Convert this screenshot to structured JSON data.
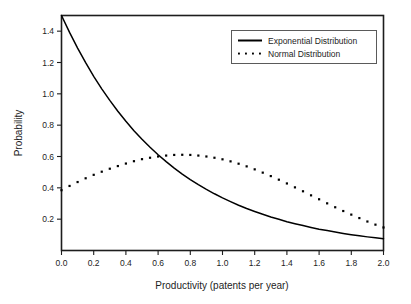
{
  "chart_data": {
    "type": "line",
    "title": "",
    "xlabel": "Productivity (patents per year)",
    "ylabel": "Probability",
    "xlim": [
      0.0,
      2.0
    ],
    "ylim": [
      0.0,
      1.5
    ],
    "xticks": [
      "0.0",
      "0.2",
      "0.4",
      "0.6",
      "0.8",
      "1.0",
      "1.2",
      "1.4",
      "1.6",
      "1.8",
      "2.0"
    ],
    "xtick_values": [
      0.0,
      0.2,
      0.4,
      0.6,
      0.8,
      1.0,
      1.2,
      1.4,
      1.6,
      1.8,
      2.0
    ],
    "yticks": [
      "0.2",
      "0.4",
      "0.6",
      "0.8",
      "1.0",
      "1.2",
      "1.4"
    ],
    "ytick_values": [
      0.2,
      0.4,
      0.6,
      0.8,
      1.0,
      1.2,
      1.4
    ],
    "grid": false,
    "legend_position": "top-right",
    "series": [
      {
        "name": "Exponential Distribution",
        "style": "solid",
        "color": "#000000",
        "x": [
          0.0,
          0.05,
          0.1,
          0.15,
          0.2,
          0.25,
          0.3,
          0.35,
          0.4,
          0.45,
          0.5,
          0.55,
          0.6,
          0.65,
          0.7,
          0.75,
          0.8,
          0.85,
          0.9,
          0.95,
          1.0,
          1.05,
          1.1,
          1.15,
          1.2,
          1.25,
          1.3,
          1.35,
          1.4,
          1.45,
          1.5,
          1.55,
          1.6,
          1.65,
          1.7,
          1.75,
          1.8,
          1.85,
          1.9,
          1.95,
          2.0
        ],
        "values": [
          1.5,
          1.392,
          1.292,
          1.199,
          1.112,
          1.032,
          0.958,
          0.889,
          0.825,
          0.765,
          0.71,
          0.659,
          0.611,
          0.567,
          0.526,
          0.488,
          0.453,
          0.42,
          0.39,
          0.362,
          0.336,
          0.312,
          0.289,
          0.268,
          0.249,
          0.231,
          0.214,
          0.199,
          0.184,
          0.171,
          0.159,
          0.147,
          0.136,
          0.127,
          0.118,
          0.109,
          0.101,
          0.094,
          0.087,
          0.081,
          0.075
        ]
      },
      {
        "name": "Normal Distribution",
        "style": "dotted",
        "color": "#000000",
        "x": [
          0.0,
          0.05,
          0.1,
          0.15,
          0.2,
          0.25,
          0.3,
          0.35,
          0.4,
          0.45,
          0.5,
          0.55,
          0.6,
          0.65,
          0.7,
          0.75,
          0.8,
          0.85,
          0.9,
          0.95,
          1.0,
          1.05,
          1.1,
          1.15,
          1.2,
          1.25,
          1.3,
          1.35,
          1.4,
          1.45,
          1.5,
          1.55,
          1.6,
          1.65,
          1.7,
          1.75,
          1.8,
          1.85,
          1.9,
          1.95,
          2.0
        ],
        "values": [
          0.385,
          0.412,
          0.437,
          0.461,
          0.483,
          0.503,
          0.522,
          0.539,
          0.555,
          0.57,
          0.583,
          0.592,
          0.6,
          0.606,
          0.61,
          0.611,
          0.61,
          0.606,
          0.6,
          0.592,
          0.582,
          0.569,
          0.554,
          0.537,
          0.518,
          0.497,
          0.475,
          0.452,
          0.428,
          0.403,
          0.378,
          0.352,
          0.327,
          0.301,
          0.276,
          0.252,
          0.229,
          0.207,
          0.185,
          0.165,
          0.147
        ]
      }
    ],
    "legend": [
      "Exponential Distribution",
      "Normal Distribution"
    ]
  },
  "legend": {
    "entries": [
      {
        "label": "Exponential Distribution",
        "marker": "solid-line-sample"
      },
      {
        "label": "Normal Distribution",
        "marker": "dotted-line-sample"
      }
    ]
  },
  "colors": {
    "axis": "#1d1d1d",
    "series": "#000000",
    "background": "#ffffff",
    "legend_border": "#5a5a5a"
  }
}
